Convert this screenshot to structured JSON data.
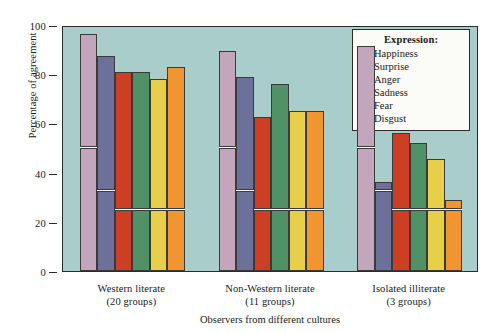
{
  "chart_data": {
    "type": "bar",
    "title": "",
    "xlabel": "Observers from different cultures",
    "ylabel": "Percentage of agreement",
    "ylim": [
      0,
      100
    ],
    "yticks": [
      0,
      20,
      40,
      60,
      80,
      100
    ],
    "grid": false,
    "legend_position": "top-right",
    "legend_title": "Expression:",
    "categories": [
      "Western literate\n(20 groups)",
      "Non-Western literate\n(11 groups)",
      "Isolated illiterate\n(3 groups)"
    ],
    "category_lines": [
      [
        "Western literate",
        "(20 groups)"
      ],
      [
        "Non-Western literate",
        "(11 groups)"
      ],
      [
        "Isolated illiterate",
        "(3 groups)"
      ]
    ],
    "series": [
      {
        "name": "Happiness",
        "color": "#c3a5bc",
        "values": [
          96.5,
          89.5,
          91.5
        ],
        "chance": [
          50,
          50,
          50
        ]
      },
      {
        "name": "Surprise",
        "color": "#6d7199",
        "values": [
          87.5,
          79.0,
          36.0
        ],
        "chance": [
          32.5,
          32.5,
          32.5
        ]
      },
      {
        "name": "Anger",
        "color": "#cc3f24",
        "values": [
          81.0,
          62.5,
          56.0
        ],
        "chance": [
          24.5,
          24.5,
          24.5
        ]
      },
      {
        "name": "Sadness",
        "color": "#509265",
        "values": [
          81.0,
          76.0,
          52.0
        ],
        "chance": [
          24.5,
          24.5,
          24.5
        ]
      },
      {
        "name": "Fear",
        "color": "#e8cf49",
        "values": [
          78.0,
          65.0,
          45.5
        ],
        "chance": [
          24.5,
          24.5,
          24.5
        ]
      },
      {
        "name": "Disgust",
        "color": "#f0952f",
        "values": [
          83.0,
          65.0,
          29.0
        ],
        "chance": [
          24.5,
          24.5,
          24.5
        ]
      }
    ],
    "plot_background": "#a8cdcb",
    "axis_color": "#2b2b2b",
    "chance_marker_color": "#ffffff"
  }
}
